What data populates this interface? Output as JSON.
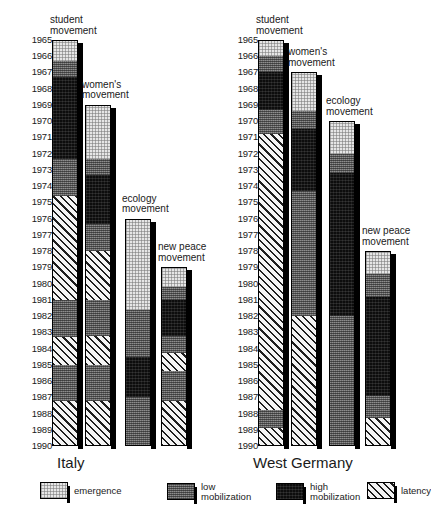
{
  "chart_data": {
    "type": "bar",
    "title": "",
    "subtitle": "",
    "xlabel": "",
    "ylabel": "",
    "orientation": "vertical-timeline",
    "axis": {
      "name": "year",
      "range": [
        1965,
        1990
      ],
      "ticks": [
        1965,
        1966,
        1967,
        1968,
        1969,
        1970,
        1971,
        1972,
        1973,
        1974,
        1975,
        1976,
        1977,
        1978,
        1979,
        1980,
        1981,
        1982,
        1983,
        1984,
        1985,
        1986,
        1987,
        1988,
        1989,
        1990
      ],
      "grid": false,
      "direction": "top-to-bottom"
    },
    "legend": {
      "position": "bottom",
      "entries": [
        {
          "key": "emergence",
          "label": "emergence",
          "color": "#e6e6e6",
          "pattern": "fine-dot"
        },
        {
          "key": "low_mobilization",
          "label": "low\nmobilization",
          "color": "#6e6e6e",
          "pattern": "medium-dot"
        },
        {
          "key": "high_mobilization",
          "label": "high\nmobilization",
          "color": "#0d0d0d",
          "pattern": "dense-dot"
        },
        {
          "key": "latency",
          "label": "latency",
          "color": "#f2f2f2",
          "pattern": "diagonal-hatch"
        }
      ]
    },
    "panels": [
      {
        "country": "Italy",
        "movements": [
          {
            "name": "student\nmovement",
            "start": 1965,
            "end": 1990,
            "phases": [
              {
                "phase": "emergence",
                "from": 1965.0,
                "to": 1966.3
              },
              {
                "phase": "low_mobilization",
                "from": 1966.3,
                "to": 1967.3
              },
              {
                "phase": "high_mobilization",
                "from": 1967.3,
                "to": 1972.3
              },
              {
                "phase": "low_mobilization",
                "from": 1972.3,
                "to": 1974.6
              },
              {
                "phase": "latency",
                "from": 1974.6,
                "to": 1981.0
              },
              {
                "phase": "low_mobilization",
                "from": 1981.0,
                "to": 1983.3
              },
              {
                "phase": "latency",
                "from": 1983.3,
                "to": 1985.0
              },
              {
                "phase": "low_mobilization",
                "from": 1985.0,
                "to": 1987.2
              },
              {
                "phase": "latency",
                "from": 1987.2,
                "to": 1990.0
              }
            ]
          },
          {
            "name": "women's\nmovement",
            "start": 1969,
            "end": 1990,
            "phases": [
              {
                "phase": "emergence",
                "from": 1969.0,
                "to": 1972.3
              },
              {
                "phase": "low_mobilization",
                "from": 1972.3,
                "to": 1973.3
              },
              {
                "phase": "high_mobilization",
                "from": 1973.3,
                "to": 1976.3
              },
              {
                "phase": "low_mobilization",
                "from": 1976.3,
                "to": 1978.0
              },
              {
                "phase": "latency",
                "from": 1978.0,
                "to": 1981.0
              },
              {
                "phase": "low_mobilization",
                "from": 1981.0,
                "to": 1983.2
              },
              {
                "phase": "latency",
                "from": 1983.2,
                "to": 1985.0
              },
              {
                "phase": "low_mobilization",
                "from": 1985.0,
                "to": 1987.2
              },
              {
                "phase": "latency",
                "from": 1987.2,
                "to": 1990.0
              }
            ]
          },
          {
            "name": "ecology\nmovement",
            "start": 1976,
            "end": 1990,
            "phases": [
              {
                "phase": "emergence",
                "from": 1976.0,
                "to": 1981.6
              },
              {
                "phase": "low_mobilization",
                "from": 1981.6,
                "to": 1984.5
              },
              {
                "phase": "high_mobilization",
                "from": 1984.5,
                "to": 1987.0
              },
              {
                "phase": "low_mobilization",
                "from": 1987.0,
                "to": 1990.0
              }
            ]
          },
          {
            "name": "new peace\nmovement",
            "start": 1979,
            "end": 1990,
            "phases": [
              {
                "phase": "emergence",
                "from": 1979.0,
                "to": 1980.2
              },
              {
                "phase": "low_mobilization",
                "from": 1980.2,
                "to": 1981.0
              },
              {
                "phase": "high_mobilization",
                "from": 1981.0,
                "to": 1983.2
              },
              {
                "phase": "low_mobilization",
                "from": 1983.2,
                "to": 1984.3
              },
              {
                "phase": "latency",
                "from": 1984.3,
                "to": 1985.4
              },
              {
                "phase": "low_mobilization",
                "from": 1985.4,
                "to": 1987.2
              },
              {
                "phase": "latency",
                "from": 1987.2,
                "to": 1990.0
              }
            ]
          }
        ]
      },
      {
        "country": "West Germany",
        "movements": [
          {
            "name": "student\nmovement",
            "start": 1965,
            "end": 1990,
            "phases": [
              {
                "phase": "emergence",
                "from": 1965.0,
                "to": 1966.0
              },
              {
                "phase": "low_mobilization",
                "from": 1966.0,
                "to": 1967.0
              },
              {
                "phase": "high_mobilization",
                "from": 1967.0,
                "to": 1969.3
              },
              {
                "phase": "low_mobilization",
                "from": 1969.3,
                "to": 1970.8
              },
              {
                "phase": "latency",
                "from": 1970.8,
                "to": 1987.8
              },
              {
                "phase": "low_mobilization",
                "from": 1987.8,
                "to": 1988.9
              },
              {
                "phase": "latency",
                "from": 1988.9,
                "to": 1990.0
              }
            ]
          },
          {
            "name": "women's\nmovement",
            "start": 1967,
            "end": 1990,
            "phases": [
              {
                "phase": "emergence",
                "from": 1967.0,
                "to": 1969.4
              },
              {
                "phase": "low_mobilization",
                "from": 1969.4,
                "to": 1970.5
              },
              {
                "phase": "high_mobilization",
                "from": 1970.5,
                "to": 1974.3
              },
              {
                "phase": "low_mobilization",
                "from": 1974.3,
                "to": 1982.0
              },
              {
                "phase": "latency",
                "from": 1982.0,
                "to": 1990.0
              }
            ]
          },
          {
            "name": "ecology\nmovement",
            "start": 1970,
            "end": 1990,
            "phases": [
              {
                "phase": "emergence",
                "from": 1970.0,
                "to": 1972.0
              },
              {
                "phase": "low_mobilization",
                "from": 1972.0,
                "to": 1973.2
              },
              {
                "phase": "high_mobilization",
                "from": 1973.2,
                "to": 1982.0
              },
              {
                "phase": "low_mobilization",
                "from": 1982.0,
                "to": 1990.0
              }
            ]
          },
          {
            "name": "new peace\nmovement",
            "start": 1978,
            "end": 1990,
            "phases": [
              {
                "phase": "emergence",
                "from": 1978.0,
                "to": 1979.4
              },
              {
                "phase": "low_mobilization",
                "from": 1979.4,
                "to": 1980.8
              },
              {
                "phase": "high_mobilization",
                "from": 1980.8,
                "to": 1986.9
              },
              {
                "phase": "low_mobilization",
                "from": 1986.9,
                "to": 1988.3
              },
              {
                "phase": "latency",
                "from": 1988.3,
                "to": 1990.0
              }
            ]
          }
        ]
      }
    ]
  },
  "layout": {
    "panel_left_x": [
      18,
      224
    ],
    "year_axis_x": [
      18,
      224
    ],
    "bar_x": [
      [
        52,
        85,
        125,
        161
      ],
      [
        258,
        291,
        329,
        365
      ]
    ],
    "bar_width": 26,
    "caption_x": [
      [
        50,
        82,
        122,
        158
      ],
      [
        256,
        288,
        326,
        362
      ]
    ],
    "country_x": [
      57,
      253
    ],
    "country_y": 455,
    "y_1965": 40,
    "year_step": 16.24
  }
}
